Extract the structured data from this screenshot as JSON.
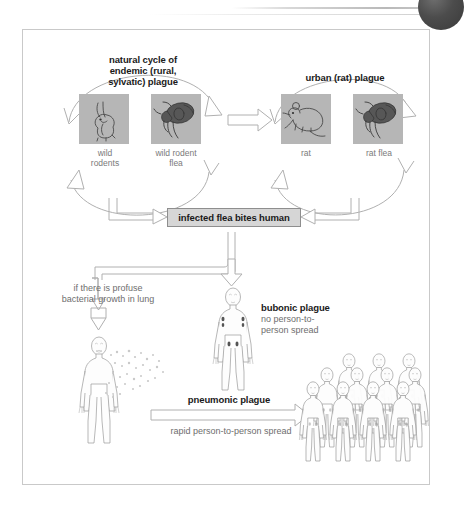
{
  "figure": {
    "title_hidden": "Plague transmission cycles",
    "cycles": [
      {
        "id": "sylvatic",
        "label": "natural cycle of\nendemic (rural,\nsylvatic) plague",
        "nodes": [
          {
            "name": "wild-rodent",
            "caption": "wild\nrodents",
            "icon": "rabbit-photo"
          },
          {
            "name": "wild-rodent-flea",
            "caption": "wild rodent\nflea",
            "icon": "flea-photo"
          }
        ]
      },
      {
        "id": "urban",
        "label": "urban (rat) plague",
        "nodes": [
          {
            "name": "rat",
            "caption": "rat",
            "icon": "rat-photo"
          },
          {
            "name": "rat-flea",
            "caption": "rat flea",
            "icon": "flea-photo"
          }
        ]
      }
    ],
    "process_box": {
      "label": "infected flea bites human"
    },
    "branches": [
      {
        "id": "bubonic",
        "title": "bubonic plague",
        "subtitle": "no person-to-\nperson spread",
        "figure_icon": "human-body-with-buboes"
      },
      {
        "id": "pneumonic",
        "condition": "if there is profuse\nbacterial growth in lung",
        "title": "pneumonic plague",
        "subtitle": "rapid person-to-person spread",
        "figure_icon": "human-body-coughing",
        "target_icon": "crowd-of-people",
        "crowd_count": 13
      }
    ],
    "colors": {
      "frame_border": "#c9c9c9",
      "photo_background": "#b9b9b9",
      "process_box_fill": "#d6d6d6",
      "process_box_border": "#8e8e8e",
      "arrow_stroke": "#b0b0b0",
      "arrow_fill": "#ffffff",
      "text_bold": "#1a1a1a",
      "text_muted": "#6e6e6e",
      "bubo": "#555555",
      "chrome_dot": "#4c4c4c"
    }
  }
}
